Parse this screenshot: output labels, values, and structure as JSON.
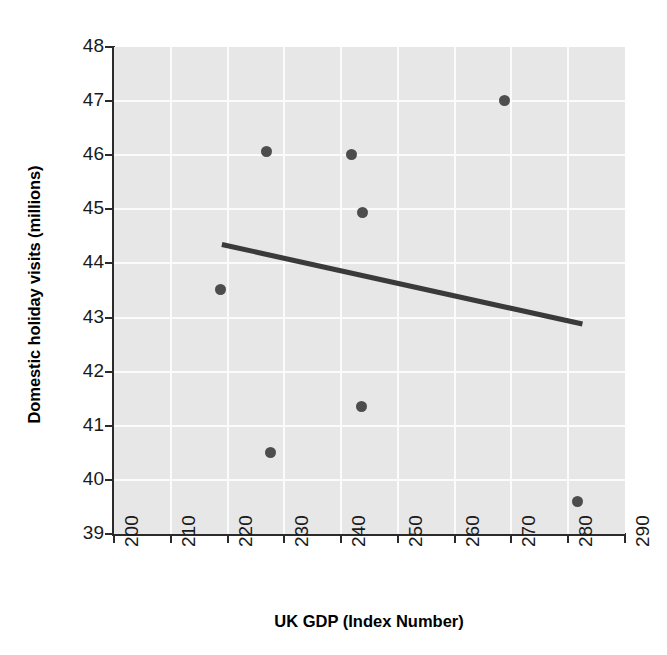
{
  "chart_data": {
    "type": "scatter",
    "title": "",
    "xlabel": "UK GDP (Index Number)",
    "ylabel": "Domestic holiday visits (millions)",
    "xlim": [
      200,
      290
    ],
    "ylim": [
      39,
      48
    ],
    "xticks": [
      200,
      210,
      220,
      230,
      240,
      250,
      260,
      270,
      280,
      290
    ],
    "ytick_labels": [
      "48",
      "47",
      "46",
      "45",
      "44",
      "43",
      "42",
      "41",
      "40",
      "39"
    ],
    "yticks": [
      48,
      47,
      46,
      45,
      44,
      43,
      42,
      41,
      40,
      39
    ],
    "xtick_labels": [
      "200",
      "210",
      "220",
      "230",
      "240",
      "250",
      "260",
      "270",
      "280",
      "290"
    ],
    "grid": true,
    "legend": "none",
    "plot_background_color": "#e7e7e7",
    "gridline_color": "#fbfbfb",
    "point_color": "#4d4d4d",
    "trendline_color": "#3a3a3a",
    "points": [
      {
        "x": 218.8,
        "y": 43.51
      },
      {
        "x": 226.9,
        "y": 46.07
      },
      {
        "x": 227.6,
        "y": 40.51
      },
      {
        "x": 241.9,
        "y": 46.02
      },
      {
        "x": 243.8,
        "y": 44.95
      },
      {
        "x": 243.6,
        "y": 41.35
      },
      {
        "x": 268.7,
        "y": 47.02
      },
      {
        "x": 281.6,
        "y": 39.6
      }
    ],
    "series": [
      {
        "name": "Domestic holiday visits",
        "x": [
          218.8,
          226.9,
          227.6,
          241.9,
          243.8,
          243.6,
          268.7,
          281.6
        ],
        "values": [
          43.51,
          46.07,
          40.51,
          46.02,
          44.95,
          41.35,
          47.02,
          39.6
        ]
      }
    ],
    "trendline": {
      "type": "linear",
      "x_start": 219.0,
      "y_start": 44.35,
      "x_end": 282.5,
      "y_end": 42.88
    }
  }
}
